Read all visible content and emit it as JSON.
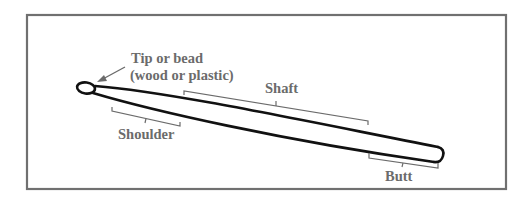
{
  "diagram": {
    "labels": {
      "tip": "Tip or bead",
      "tip_sub": "(wood or plastic)",
      "shaft": "Shaft",
      "shoulder": "Shoulder",
      "butt": "Butt"
    },
    "colors": {
      "frame": "#707070",
      "stick": "#111111",
      "label": "#6b6b6b",
      "bracket": "#6b6b6b"
    }
  }
}
